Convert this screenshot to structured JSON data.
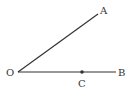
{
  "diagram": {
    "type": "geometry-angle",
    "colors": {
      "line": "#333333",
      "label": "#333333",
      "background": "#ffffff"
    },
    "points": {
      "O": {
        "label": "O",
        "x": 18,
        "y": 72
      },
      "A": {
        "label": "A",
        "x": 98,
        "y": 14
      },
      "B": {
        "label": "B",
        "x": 116,
        "y": 72
      },
      "C": {
        "label": "C",
        "x": 82,
        "y": 72
      }
    },
    "rays": [
      {
        "from": "O",
        "to": "A"
      },
      {
        "from": "O",
        "to": "B"
      }
    ],
    "labels": {
      "O": "O",
      "A": "A",
      "B": "B",
      "C": "C"
    }
  }
}
